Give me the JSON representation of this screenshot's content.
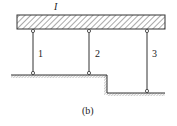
{
  "diagram": {
    "beam_label": "I",
    "rods": [
      {
        "label": "1"
      },
      {
        "label": "2"
      },
      {
        "label": "3"
      }
    ],
    "caption": "(b)",
    "colors": {
      "line": "#333333",
      "hatch": "#555555",
      "background": "#ffffff"
    }
  }
}
